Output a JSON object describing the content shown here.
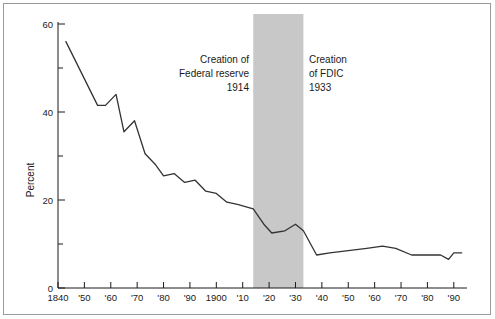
{
  "figure": {
    "background_color": "#ffffff",
    "border_color": "#9a9a9a",
    "line_color": "#333333",
    "band_color": "#c8c8c8"
  },
  "annotations": {
    "fed": {
      "line1": "Creation of",
      "line2": "Federal reserve",
      "line3": "1914"
    },
    "fdic": {
      "line1": "Creation",
      "line2": "of FDIC",
      "line3": "1933"
    }
  },
  "chart_data": {
    "type": "line",
    "title": "",
    "xlabel": "",
    "ylabel": "Percent",
    "xlim": [
      1840,
      1995
    ],
    "ylim": [
      0,
      60
    ],
    "grid": false,
    "legend": null,
    "y_ticks_major": [
      0,
      20,
      40,
      60
    ],
    "y_tick_labels": [
      "0",
      "20",
      "40",
      "60"
    ],
    "y_ticks_minor": [
      10,
      30,
      50
    ],
    "x_ticks": [
      1840,
      1850,
      1860,
      1870,
      1880,
      1890,
      1900,
      1910,
      1920,
      1930,
      1940,
      1950,
      1960,
      1970,
      1980,
      1990
    ],
    "x_tick_labels": [
      "1840",
      "'50",
      "'60",
      "'70",
      "'80",
      "'90",
      "1900",
      "'10",
      "'20",
      "'30",
      "'40",
      "'50",
      "'60",
      "'70",
      "'80",
      "'90"
    ],
    "shaded_band": {
      "label": "Federal reserve to FDIC era",
      "x_start": 1914,
      "x_end": 1933,
      "color": "#c8c8c8"
    },
    "series": [
      {
        "name": "Percent",
        "x": [
          1843,
          1855,
          1858,
          1862,
          1865,
          1869,
          1873,
          1877,
          1880,
          1884,
          1888,
          1892,
          1896,
          1900,
          1904,
          1908,
          1914,
          1918,
          1921,
          1926,
          1930,
          1933,
          1938,
          1943,
          1950,
          1957,
          1963,
          1968,
          1974,
          1980,
          1985,
          1988,
          1990,
          1993
        ],
        "y": [
          56.0,
          41.5,
          41.5,
          44.0,
          35.5,
          38.0,
          30.5,
          28.0,
          25.5,
          26.0,
          24.0,
          24.5,
          22.0,
          21.5,
          19.5,
          19.0,
          18.0,
          14.5,
          12.5,
          13.0,
          14.5,
          13.0,
          7.5,
          8.0,
          8.5,
          9.0,
          9.5,
          9.0,
          7.5,
          7.5,
          7.5,
          6.5,
          8.0,
          8.0
        ]
      }
    ]
  }
}
